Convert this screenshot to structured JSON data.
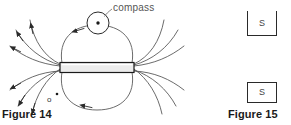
{
  "page": {
    "background_color": "#ffffff",
    "width": 291,
    "height": 125
  },
  "figures": [
    {
      "id": "figure-14",
      "caption": "Figure 14",
      "subject": "bar magnet magnetic field lines with compass",
      "labels": {
        "compass": "compass",
        "point_marker": "o"
      },
      "magnet": {
        "fill_color": "#ebebeb",
        "stroke_color": "#1a1a1a"
      },
      "line_color": "#5a5a5a"
    },
    {
      "id": "figure-15",
      "caption": "Figure 15",
      "subject": "two open boxes labelled S",
      "boxes": [
        {
          "id": "box-top",
          "label": "S"
        },
        {
          "id": "box-bottom",
          "label": "S"
        }
      ],
      "stroke_color": "#2a2a2a"
    }
  ],
  "colors": {
    "ink": "#1a1a1a",
    "field_line": "#5a5a5a",
    "magnet_fill": "#ebebeb",
    "label_gray": "#555555"
  }
}
